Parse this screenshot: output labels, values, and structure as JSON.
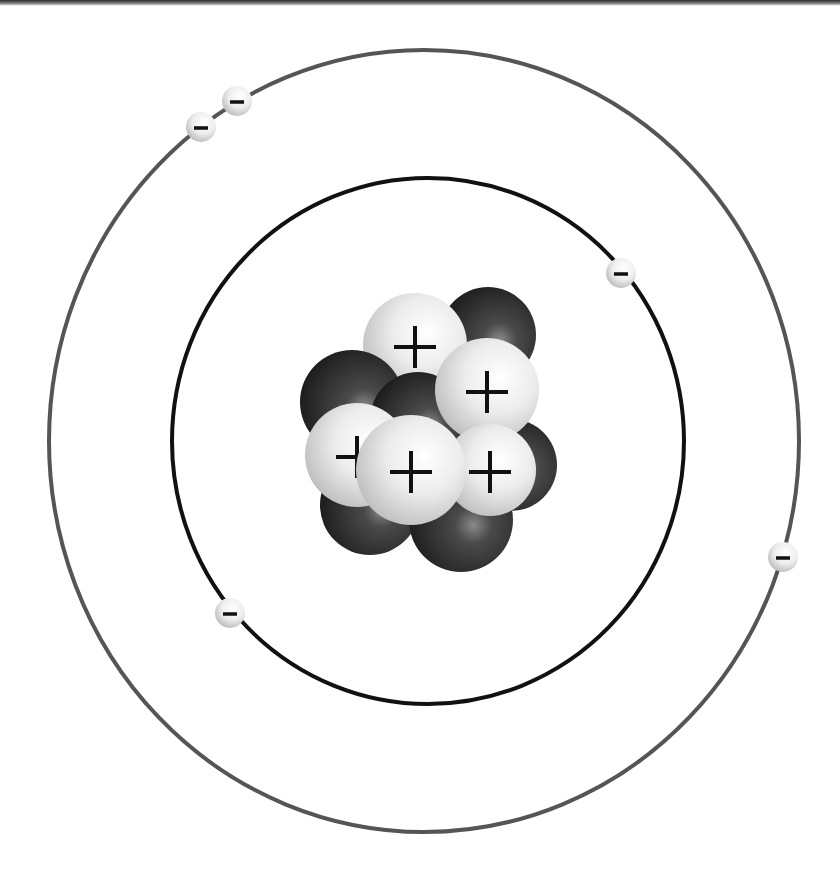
{
  "diagram": {
    "colors": {
      "background": "#ffffff",
      "outer_orbit": "#555555",
      "inner_orbit": "#111111",
      "proton": "#e6e6e6",
      "neutron": "#2a2a2a",
      "electron": "#f2f2f2",
      "sign": "#111111"
    },
    "nucleus": {
      "proton_sign": "+",
      "particles": [
        {
          "type": "neutron",
          "cx": 488,
          "cy": 335,
          "r": 48
        },
        {
          "type": "proton",
          "cx": 415,
          "cy": 345,
          "r": 52,
          "label": "+"
        },
        {
          "type": "neutron",
          "cx": 352,
          "cy": 402,
          "r": 52
        },
        {
          "type": "neutron",
          "cx": 511,
          "cy": 465,
          "r": 46
        },
        {
          "type": "neutron",
          "cx": 370,
          "cy": 505,
          "r": 50
        },
        {
          "type": "neutron",
          "cx": 461,
          "cy": 520,
          "r": 52
        },
        {
          "type": "neutron",
          "cx": 418,
          "cy": 420,
          "r": 48
        },
        {
          "type": "proton",
          "cx": 487,
          "cy": 390,
          "r": 52,
          "label": "+"
        },
        {
          "type": "proton",
          "cx": 490,
          "cy": 470,
          "r": 46,
          "label": "+"
        },
        {
          "type": "proton",
          "cx": 357,
          "cy": 455,
          "r": 52,
          "label": "+"
        },
        {
          "type": "proton",
          "cx": 411,
          "cy": 470,
          "r": 55,
          "label": "+"
        }
      ]
    },
    "orbits": [
      {
        "name": "inner-orbit",
        "cx": 428,
        "cy": 441,
        "rx": 256,
        "ry": 263,
        "stroke_width": 4
      },
      {
        "name": "outer-orbit",
        "cx": 424,
        "cy": 441,
        "rx": 375,
        "ry": 391,
        "stroke_width": 4
      }
    ],
    "electrons": [
      {
        "orbit": "outer",
        "cx": 237,
        "cy": 101,
        "r": 15,
        "label": "−"
      },
      {
        "orbit": "outer",
        "cx": 201,
        "cy": 127,
        "r": 15,
        "label": "−"
      },
      {
        "orbit": "inner",
        "cx": 621,
        "cy": 273,
        "r": 15,
        "label": "−"
      },
      {
        "orbit": "outer",
        "cx": 783,
        "cy": 557,
        "r": 15,
        "label": "−"
      },
      {
        "orbit": "inner",
        "cx": 230,
        "cy": 613,
        "r": 15,
        "label": "−"
      }
    ],
    "counts": {
      "protons": 5,
      "neutrons": 6,
      "electrons": 5
    }
  }
}
